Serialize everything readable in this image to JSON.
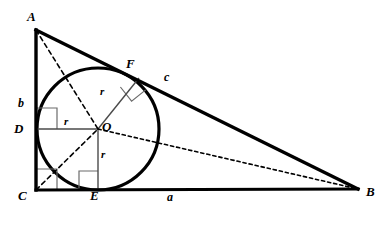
{
  "figure": {
    "background_color": "#ffffff",
    "stroke_color": "#000000",
    "thin_stroke_color": "#555555"
  },
  "vertices": {
    "A": {
      "label": "A",
      "x": 36,
      "y": 30,
      "label_x": 27,
      "label_y": 10
    },
    "B": {
      "label": "B",
      "x": 358,
      "y": 189,
      "label_x": 366,
      "label_y": 191
    },
    "C": {
      "label": "C",
      "x": 36,
      "y": 190,
      "label_x": 24,
      "label_y": 196
    }
  },
  "tangent_points": {
    "D": {
      "label": "D",
      "x": 36,
      "y": 129,
      "label_x": 19,
      "label_y": 122
    },
    "E": {
      "label": "E",
      "x": 98,
      "y": 190,
      "label_x": 91,
      "label_y": 196
    },
    "F": {
      "label": "F",
      "x": 139,
      "y": 78,
      "label_x": 127,
      "label_y": 59
    }
  },
  "incircle": {
    "center": {
      "label": "O",
      "x": 98,
      "y": 129,
      "label_x": 103,
      "label_y": 121
    },
    "radius": 61
  },
  "side_labels": [
    {
      "name": "a",
      "text": "a",
      "x": 168,
      "y": 192
    },
    {
      "name": "b",
      "text": "b",
      "x": 21,
      "y": 98
    },
    {
      "name": "c",
      "text": "c",
      "x": 164,
      "y": 73
    }
  ],
  "radius_labels": [
    {
      "name": "radius-to-D",
      "text": "r",
      "x": 64,
      "y": 118
    },
    {
      "name": "radius-to-E",
      "text": "r",
      "x": 102,
      "y": 150
    },
    {
      "name": "radius-to-F",
      "text": "r",
      "x": 101,
      "y": 87
    }
  ],
  "geometry": {
    "right_angle_marks": [
      {
        "name": "right-angle-at-C",
        "x": 36,
        "y": 190,
        "size": 21,
        "dx": 1,
        "dy": -1
      },
      {
        "name": "right-angle-at-D",
        "x": 36,
        "y": 129,
        "size": 21,
        "dx": 1,
        "dy": -1
      },
      {
        "name": "right-angle-at-E",
        "x": 98,
        "y": 190,
        "size": 19,
        "dx": -1,
        "dy": -1
      },
      {
        "name": "right-angle-at-F",
        "size": 15
      }
    ],
    "bisectors": [
      "A-O",
      "C-O",
      "O-B"
    ],
    "radii": [
      "O-D",
      "O-E",
      "O-F"
    ]
  }
}
